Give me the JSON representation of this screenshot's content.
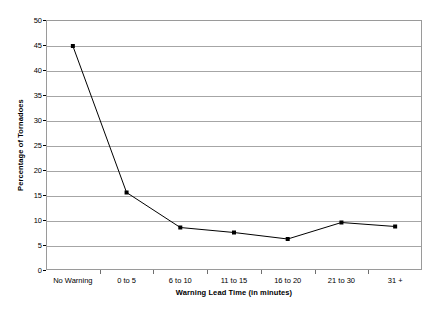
{
  "chart_data": {
    "type": "line",
    "title": "",
    "xlabel": "Warning Lead Time (in minutes)",
    "ylabel": "Percentage of Tornadoes",
    "categories": [
      "No Warning",
      "0 to 5",
      "6 to 10",
      "11 to 15",
      "16 to 20",
      "21 to 30",
      "31 +"
    ],
    "values": [
      44.8,
      15.5,
      8.5,
      7.5,
      6.2,
      9.5,
      8.7
    ],
    "series": [
      {
        "name": "Percentage of Tornadoes",
        "values": [
          44.8,
          15.5,
          8.5,
          7.5,
          6.2,
          9.5,
          8.7
        ]
      }
    ],
    "ylim": [
      0,
      50
    ],
    "ytick_labels": [
      "50",
      "45",
      "40",
      "35",
      "30",
      "25",
      "20",
      "15",
      "10",
      "5",
      "0"
    ],
    "ytick_values": [
      50,
      45,
      40,
      35,
      30,
      25,
      20,
      15,
      10,
      5,
      0
    ],
    "ytick_step": 5,
    "grid": true,
    "grid_axis": "y",
    "legend": false,
    "legend_position": "none",
    "marker": "square",
    "line_color": "#000000",
    "marker_color": "#000000",
    "grid_color": "#a6a6a6",
    "plot_border_color": "#9a9a9a",
    "background_color": "#ffffff"
  }
}
